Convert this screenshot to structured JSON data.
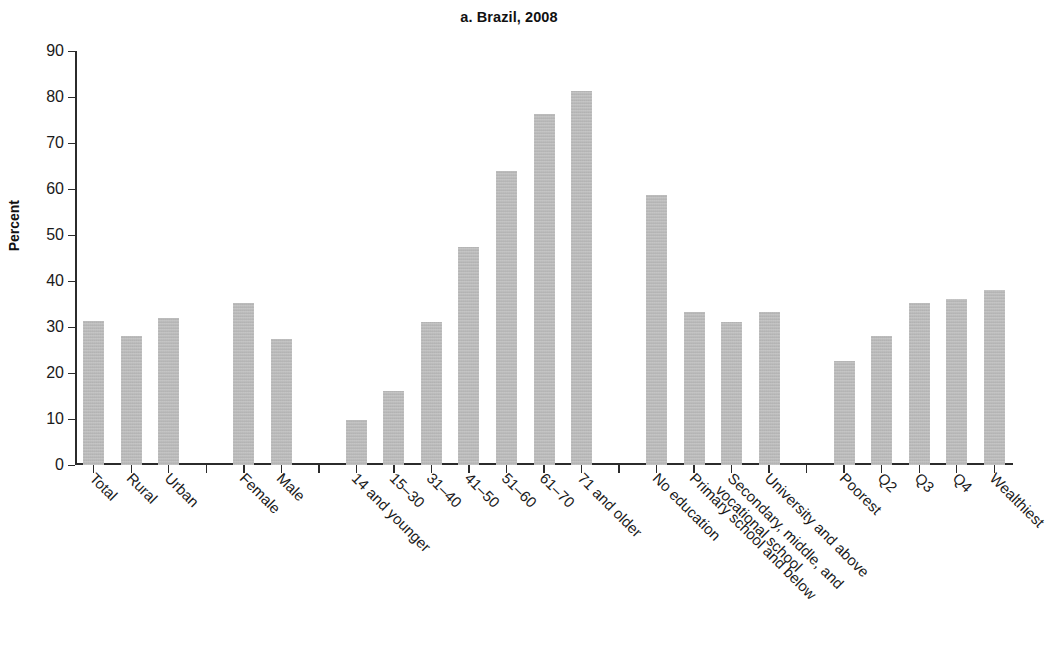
{
  "chart_data": {
    "type": "bar",
    "title": "a. Brazil, 2008",
    "xlabel": "",
    "ylabel": "Percent",
    "ylim": [
      0,
      90
    ],
    "yticks": [
      0,
      10,
      20,
      30,
      40,
      50,
      60,
      70,
      80,
      90
    ],
    "grid": false,
    "legend": "none",
    "bar_color": "#b4b4b4",
    "axis_color": "#2b2b2b",
    "categories": [
      "Total",
      "Rural",
      "Urban",
      "Female",
      "Male",
      "14 and younger",
      "15–30",
      "31–40",
      "41–50",
      "51–60",
      "61–70",
      "71 and older",
      "No education",
      "Primary school and below",
      "Secondary, middle, and vocational school",
      "University and above",
      "Poorest",
      "Q2",
      "Q3",
      "Q4",
      "Wealthiest"
    ],
    "values": [
      31.2,
      28.0,
      32.0,
      35.3,
      27.5,
      9.8,
      16.1,
      31.0,
      47.5,
      64.0,
      76.3,
      81.4,
      58.8,
      33.2,
      31.0,
      33.2,
      22.7,
      28.0,
      35.2,
      36.0,
      38.0
    ],
    "groups": [
      {
        "name": "overall",
        "categories": [
          "Total",
          "Rural",
          "Urban"
        ]
      },
      {
        "name": "sex",
        "categories": [
          "Female",
          "Male"
        ]
      },
      {
        "name": "age",
        "categories": [
          "14 and younger",
          "15–30",
          "31–40",
          "41–50",
          "51–60",
          "61–70",
          "71 and older"
        ]
      },
      {
        "name": "education",
        "categories": [
          "No education",
          "Primary school and below",
          "Secondary, middle, and vocational school",
          "University and above"
        ]
      },
      {
        "name": "wealth",
        "categories": [
          "Poorest",
          "Q2",
          "Q3",
          "Q4",
          "Wealthiest"
        ]
      }
    ],
    "slots": [
      {
        "slot": 0,
        "label": "Total",
        "label_lines": [
          "Total"
        ],
        "value": 31.2
      },
      {
        "slot": 1,
        "label": "Rural",
        "label_lines": [
          "Rural"
        ],
        "value": 28.0
      },
      {
        "slot": 2,
        "label": "Urban",
        "label_lines": [
          "Urban"
        ],
        "value": 32.0
      },
      {
        "slot": 3,
        "label": "",
        "label_lines": [],
        "value": null
      },
      {
        "slot": 4,
        "label": "Female",
        "label_lines": [
          "Female"
        ],
        "value": 35.3
      },
      {
        "slot": 5,
        "label": "Male",
        "label_lines": [
          "Male"
        ],
        "value": 27.5
      },
      {
        "slot": 6,
        "label": "",
        "label_lines": [],
        "value": null
      },
      {
        "slot": 7,
        "label": "14 and younger",
        "label_lines": [
          "14 and younger"
        ],
        "value": 9.8
      },
      {
        "slot": 8,
        "label": "15–30",
        "label_lines": [
          "15–30"
        ],
        "value": 16.1
      },
      {
        "slot": 9,
        "label": "31–40",
        "label_lines": [
          "31–40"
        ],
        "value": 31.0
      },
      {
        "slot": 10,
        "label": "41–50",
        "label_lines": [
          "41–50"
        ],
        "value": 47.5
      },
      {
        "slot": 11,
        "label": "51–60",
        "label_lines": [
          "51–60"
        ],
        "value": 64.0
      },
      {
        "slot": 12,
        "label": "61–70",
        "label_lines": [
          "61–70"
        ],
        "value": 76.3
      },
      {
        "slot": 13,
        "label": "71 and older",
        "label_lines": [
          "71 and older"
        ],
        "value": 81.4
      },
      {
        "slot": 14,
        "label": "",
        "label_lines": [],
        "value": null
      },
      {
        "slot": 15,
        "label": "No education",
        "label_lines": [
          "No education"
        ],
        "value": 58.8
      },
      {
        "slot": 16,
        "label": "Primary school and below",
        "label_lines": [
          "Primary school and below"
        ],
        "value": 33.2
      },
      {
        "slot": 17,
        "label": "Secondary, middle, and vocational school",
        "label_lines": [
          "Secondary, middle, and",
          "vocational school"
        ],
        "value": 31.0
      },
      {
        "slot": 18,
        "label": "University and above",
        "label_lines": [
          "University and above"
        ],
        "value": 33.2
      },
      {
        "slot": 19,
        "label": "",
        "label_lines": [],
        "value": null
      },
      {
        "slot": 20,
        "label": "Poorest",
        "label_lines": [
          "Poorest"
        ],
        "value": 22.7
      },
      {
        "slot": 21,
        "label": "Q2",
        "label_lines": [
          "Q2"
        ],
        "value": 28.0
      },
      {
        "slot": 22,
        "label": "Q3",
        "label_lines": [
          "Q3"
        ],
        "value": 35.2
      },
      {
        "slot": 23,
        "label": "Q4",
        "label_lines": [
          "Q4"
        ],
        "value": 36.0
      },
      {
        "slot": 24,
        "label": "Wealthiest",
        "label_lines": [
          "Wealthiest"
        ],
        "value": 38.0
      }
    ]
  }
}
